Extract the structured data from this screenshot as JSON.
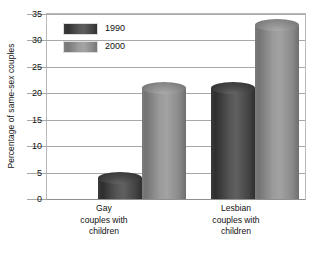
{
  "chart_data": {
    "type": "bar",
    "title": "",
    "xlabel": "",
    "ylabel": "Percentage of same-sex couples",
    "ylim": [
      0,
      35
    ],
    "ytick_step": 5,
    "yticks": [
      "35",
      "30",
      "25",
      "20",
      "15",
      "10",
      "5",
      "0"
    ],
    "grid": "horizontal",
    "legend_position": "top-left-inside",
    "categories": [
      "Gay\ncouples with\nchildren",
      "Lesbian\ncouples with\nchildren"
    ],
    "category_lines": [
      [
        "Gay",
        "couples with",
        "children"
      ],
      [
        "Lesbian",
        "couples with",
        "children"
      ]
    ],
    "series": [
      {
        "name": "1990",
        "color": "#4a4a4a",
        "values": [
          4,
          21
        ]
      },
      {
        "name": "2000",
        "color": "#8f8f8f",
        "values": [
          21,
          33
        ]
      }
    ]
  },
  "axis": {
    "y_title": "Percentage of same-sex couples",
    "ticks": [
      {
        "label": "35",
        "value": 35
      },
      {
        "label": "30",
        "value": 30
      },
      {
        "label": "25",
        "value": 25
      },
      {
        "label": "20",
        "value": 20
      },
      {
        "label": "15",
        "value": 15
      },
      {
        "label": "10",
        "value": 10
      },
      {
        "label": "5",
        "value": 5
      },
      {
        "label": "0",
        "value": 0
      }
    ]
  },
  "legend": {
    "items": [
      {
        "label": "1990"
      },
      {
        "label": "2000"
      }
    ]
  },
  "categories": [
    {
      "line1": "Gay",
      "line2": "couples with",
      "line3": "children"
    },
    {
      "line1": "Lesbian",
      "line2": "couples with",
      "line3": "children"
    }
  ]
}
